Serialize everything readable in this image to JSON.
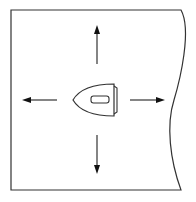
{
  "diagram": {
    "title": "",
    "elements": {
      "fabric": {
        "label": "fabric sheet"
      },
      "iron": {
        "label": "iron",
        "pointing": "left"
      },
      "arrows": [
        {
          "direction": "up"
        },
        {
          "direction": "down"
        },
        {
          "direction": "left"
        },
        {
          "direction": "right"
        }
      ]
    },
    "colors": {
      "stroke": "#222222",
      "background": "#ffffff"
    }
  }
}
